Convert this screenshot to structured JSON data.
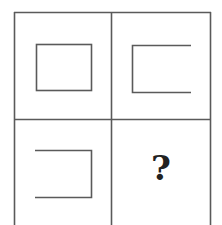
{
  "puzzle": {
    "type": "2x2 figure matrix",
    "colors": {
      "line": "#5a5a5a",
      "background": "#ffffff",
      "text": "#222222"
    },
    "cells": [
      {
        "position": "top-left",
        "figure": "closed rectangle"
      },
      {
        "position": "top-right",
        "figure": "rectangle open on right side"
      },
      {
        "position": "bottom-left",
        "figure": "rectangle open on left side"
      },
      {
        "position": "bottom-right",
        "figure": "unknown",
        "label": "?"
      }
    ]
  }
}
